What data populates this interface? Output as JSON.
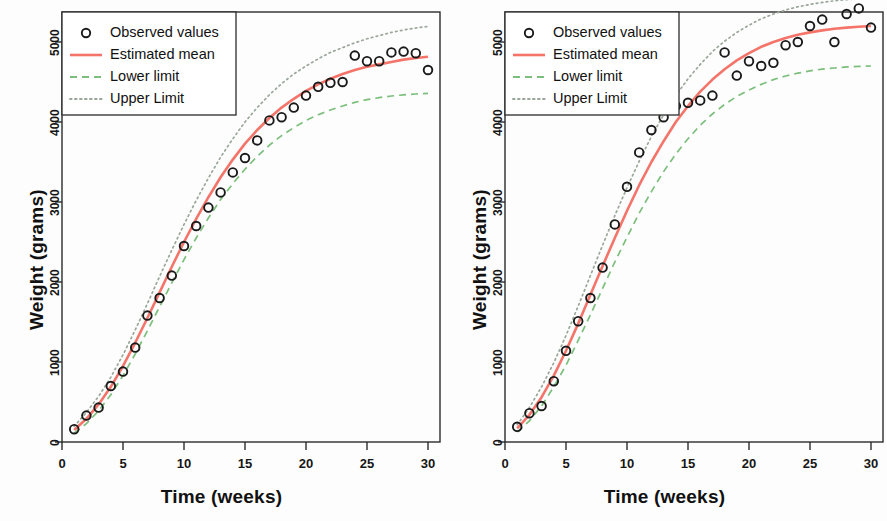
{
  "figure": {
    "background": "#fdfdfd",
    "panel_count": 2
  },
  "axis": {
    "xlabel": "Time (weeks)",
    "ylabel": "Weight (grams)",
    "xticks": [
      "0",
      "5",
      "10",
      "15",
      "20",
      "25",
      "30"
    ],
    "yticks": [
      "0",
      "1000",
      "2000",
      "3000",
      "4000",
      "5000"
    ]
  },
  "legend": {
    "items": [
      {
        "label": "Observed values",
        "marker": "circle-open-icon",
        "color": "#1a1a1a"
      },
      {
        "label": "Estimated mean",
        "marker": "solid-line-icon",
        "color": "#f4746a"
      },
      {
        "label": "Lower limit",
        "marker": "dashed-line-icon",
        "color": "#7cbf7c"
      },
      {
        "label": "Upper Limit",
        "marker": "dotted-line-icon",
        "color": "#9aa79a"
      }
    ]
  },
  "chart_data": [
    {
      "type": "line",
      "panel": "left",
      "title": "",
      "xlabel": "Time (weeks)",
      "ylabel": "Weight (grams)",
      "xlim": [
        0,
        31
      ],
      "ylim": [
        0,
        5300
      ],
      "xticks": [
        0,
        5,
        10,
        15,
        20,
        25,
        30
      ],
      "yticks": [
        0,
        1000,
        2000,
        3000,
        4000,
        5000
      ],
      "grid": false,
      "legend_position": "top-left",
      "x": [
        1,
        2,
        3,
        4,
        5,
        6,
        7,
        8,
        9,
        10,
        11,
        12,
        13,
        14,
        15,
        16,
        17,
        18,
        19,
        20,
        21,
        22,
        23,
        24,
        25,
        26,
        27,
        28,
        29,
        30
      ],
      "series": [
        {
          "name": "Observed values",
          "type": "scatter",
          "marker": "circle-open",
          "color": "#1a1a1a",
          "values": [
            160,
            330,
            430,
            700,
            880,
            1180,
            1580,
            1800,
            2080,
            2450,
            2700,
            2930,
            3120,
            3370,
            3550,
            3770,
            4020,
            4060,
            4180,
            4330,
            4440,
            4490,
            4500,
            4830,
            4760,
            4760,
            4870,
            4880,
            4860,
            4650
          ]
        },
        {
          "name": "Estimated mean",
          "type": "line",
          "style": "solid",
          "color": "#f4746a",
          "values": [
            150,
            290,
            470,
            690,
            950,
            1240,
            1550,
            1870,
            2190,
            2500,
            2790,
            3060,
            3310,
            3530,
            3730,
            3900,
            4050,
            4180,
            4290,
            4390,
            4470,
            4540,
            4600,
            4650,
            4690,
            4720,
            4750,
            4780,
            4800,
            4815
          ]
        },
        {
          "name": "Lower limit",
          "type": "line",
          "style": "dashed",
          "color": "#7cbf7c",
          "values": [
            110,
            230,
            390,
            590,
            830,
            1100,
            1390,
            1690,
            1990,
            2280,
            2550,
            2800,
            3030,
            3230,
            3410,
            3570,
            3710,
            3830,
            3930,
            4020,
            4090,
            4150,
            4200,
            4245,
            4280,
            4305,
            4325,
            4340,
            4350,
            4358
          ]
        },
        {
          "name": "Upper Limit",
          "type": "line",
          "style": "dotted",
          "color": "#9aa79a",
          "values": [
            195,
            370,
            570,
            810,
            1090,
            1400,
            1730,
            2070,
            2400,
            2720,
            3020,
            3300,
            3560,
            3790,
            4000,
            4180,
            4340,
            4480,
            4600,
            4700,
            4790,
            4870,
            4930,
            4990,
            5040,
            5080,
            5120,
            5150,
            5175,
            5195
          ]
        }
      ]
    },
    {
      "type": "line",
      "panel": "right",
      "title": "",
      "xlabel": "Time (weeks)",
      "ylabel": "Weight (grams)",
      "xlim": [
        0,
        31
      ],
      "ylim": [
        0,
        5600
      ],
      "xticks": [
        0,
        5,
        10,
        15,
        20,
        25,
        30
      ],
      "yticks": [
        0,
        1000,
        2000,
        3000,
        4000,
        5000
      ],
      "grid": false,
      "legend_position": "top-left",
      "x": [
        1,
        2,
        3,
        4,
        5,
        6,
        7,
        8,
        9,
        10,
        11,
        12,
        13,
        14,
        15,
        16,
        17,
        18,
        19,
        20,
        21,
        22,
        23,
        24,
        25,
        26,
        27,
        28,
        29,
        30
      ],
      "series": [
        {
          "name": "Observed values",
          "type": "scatter",
          "marker": "circle-open",
          "color": "#1a1a1a",
          "values": [
            190,
            360,
            450,
            760,
            1140,
            1510,
            1800,
            2180,
            2720,
            3190,
            3620,
            3900,
            4060,
            4200,
            4240,
            4270,
            4330,
            4870,
            4580,
            4760,
            4700,
            4740,
            4960,
            5000,
            5200,
            5280,
            5000,
            5350,
            5420,
            5180
          ]
        },
        {
          "name": "Estimated mean",
          "type": "line",
          "style": "solid",
          "color": "#f4746a",
          "values": [
            170,
            340,
            560,
            830,
            1140,
            1480,
            1840,
            2200,
            2550,
            2890,
            3210,
            3500,
            3760,
            4000,
            4200,
            4380,
            4530,
            4660,
            4770,
            4860,
            4940,
            5000,
            5050,
            5090,
            5120,
            5145,
            5165,
            5180,
            5190,
            5200
          ]
        },
        {
          "name": "Lower limit",
          "type": "line",
          "style": "dashed",
          "color": "#7cbf7c",
          "values": [
            125,
            265,
            450,
            690,
            960,
            1270,
            1590,
            1920,
            2250,
            2560,
            2860,
            3130,
            3380,
            3600,
            3790,
            3960,
            4100,
            4220,
            4320,
            4400,
            4470,
            4530,
            4575,
            4610,
            4640,
            4660,
            4675,
            4688,
            4695,
            4700
          ]
        },
        {
          "name": "Upper Limit",
          "type": "line",
          "style": "dotted",
          "color": "#9aa79a",
          "values": [
            215,
            430,
            690,
            990,
            1330,
            1700,
            2080,
            2460,
            2830,
            3180,
            3510,
            3820,
            4090,
            4330,
            4540,
            4720,
            4880,
            5010,
            5120,
            5210,
            5290,
            5350,
            5400,
            5440,
            5470,
            5495,
            5515,
            5530,
            5540,
            5548
          ]
        }
      ]
    }
  ]
}
